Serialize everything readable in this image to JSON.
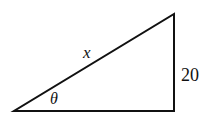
{
  "diagram": {
    "type": "right-triangle",
    "labels": {
      "hypotenuse": "x",
      "angle": "θ",
      "opposite_side": "20"
    },
    "stroke_color": "#111111",
    "background": "#ffffff"
  }
}
